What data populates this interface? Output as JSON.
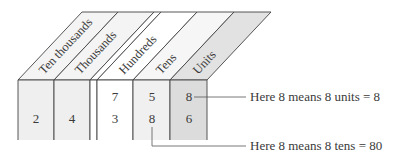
{
  "diagram": {
    "type": "place-value-chart",
    "columns": [
      {
        "label": "Ten thousands",
        "digits": [
          "",
          "2"
        ],
        "fill": "#efefef"
      },
      {
        "label": "Thousands",
        "digits": [
          "",
          "4"
        ],
        "fill": "#efefef"
      },
      {
        "label": "Hundreds",
        "digits": [
          "7",
          "3"
        ],
        "fill": "#ffffff"
      },
      {
        "label": "Tens",
        "digits": [
          "5",
          "8"
        ],
        "fill": "#f0f0f0"
      },
      {
        "label": "Units",
        "digits": [
          "8",
          "6"
        ],
        "fill": "#dcdcdc"
      }
    ],
    "annotations": [
      {
        "text": "Here 8 means 8 units = 8",
        "points_to": "Units row 1"
      },
      {
        "text": "Here 8 means 8 tens = 80",
        "points_to": "Tens row 2"
      }
    ]
  }
}
